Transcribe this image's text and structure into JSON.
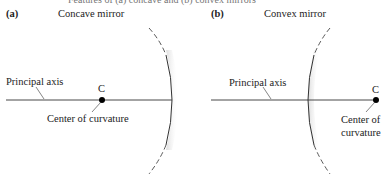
{
  "caption": "Features of (a) concave and (b) convex mirrors",
  "panels": [
    {
      "letter": "(a)",
      "title": "Concave mirror",
      "axis_label": "Principal axis",
      "point_label": "C",
      "point_caption": "Center of curvature"
    },
    {
      "letter": "(b)",
      "title": "Convex mirror",
      "axis_label": "Principal axis",
      "point_label": "C",
      "point_caption_line1": "Center of",
      "point_caption_line2": "curvature"
    }
  ],
  "colors": {
    "line": "#333333",
    "mirror_shade": "#d8d8d8",
    "dot": "#000000"
  }
}
